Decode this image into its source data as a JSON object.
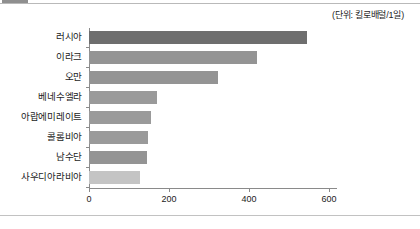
{
  "figure": {
    "unit_note": "(단위: 킬로배럴/1일)"
  },
  "chart_data": {
    "type": "bar",
    "orientation": "horizontal",
    "title": "",
    "subtitle": "",
    "xlabel": "",
    "ylabel": "",
    "unit_note": "(단위: 킬로배럴/1일)",
    "categories": [
      "러시아",
      "이라크",
      "오만",
      "베네수엘라",
      "아랍에미레이트",
      "콜롬비아",
      "남수단",
      "사우디아라비아"
    ],
    "values": [
      546,
      419,
      323,
      171,
      154,
      147,
      145,
      127
    ],
    "bar_colors": [
      "#6e6e6e",
      "#949494",
      "#949494",
      "#9a9a9a",
      "#9a9a9a",
      "#9a9a9a",
      "#949494",
      "#c4c4c4"
    ],
    "xlim": [
      0,
      620
    ],
    "xticks": [
      0,
      200,
      400,
      600
    ],
    "xtick_labels": [
      "0",
      "200",
      "400",
      "600"
    ],
    "grid": false,
    "legend": false,
    "legend_position": "none"
  }
}
